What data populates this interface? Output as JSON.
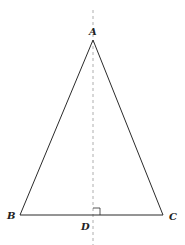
{
  "diagram": {
    "stroke_color": "#2b2b2b",
    "axis_color": "#9a9a9a",
    "points": {
      "A": {
        "label": "A",
        "x": 93,
        "y": 40
      },
      "B": {
        "label": "B",
        "x": 20,
        "y": 215
      },
      "C": {
        "label": "C",
        "x": 163,
        "y": 215
      },
      "D": {
        "label": "D",
        "x": 93,
        "y": 215
      }
    },
    "labels": {
      "A": "A",
      "B": "B",
      "C": "C",
      "D": "D"
    },
    "segments": [
      {
        "from": "A",
        "to": "B",
        "style": "solid"
      },
      {
        "from": "A",
        "to": "C",
        "style": "solid"
      },
      {
        "from": "B",
        "to": "C",
        "style": "solid"
      }
    ],
    "symmetry_axis": {
      "x": 93,
      "y1": 10,
      "y2": 245,
      "style": "dashed"
    },
    "right_angle_marker": {
      "at": "D",
      "size": 7
    }
  }
}
